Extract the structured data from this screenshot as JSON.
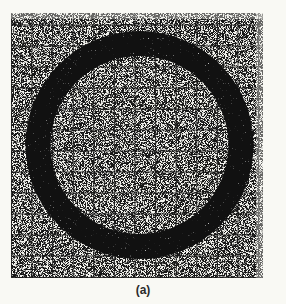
{
  "figure": {
    "caption": "(a)",
    "panel": {
      "x": 11,
      "y": 13,
      "width": 252,
      "height": 265,
      "grid_spacing_px": 20.6,
      "grid_color": "#1a1a1a",
      "noise_density": "high",
      "background": "#f9f9f4"
    },
    "ring": {
      "center_x": 139.5,
      "center_y": 145,
      "outer_radius": 114,
      "inner_radius": 89,
      "color": "#111111"
    }
  }
}
